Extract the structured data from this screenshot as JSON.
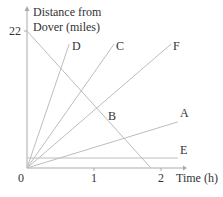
{
  "chart_data": {
    "type": "line",
    "title": "",
    "xlabel": "Time (h)",
    "ylabel": "Distance from Dover (miles)",
    "ylabel_lines": [
      "Distance from",
      "Dover (miles)"
    ],
    "xlim": [
      0,
      2.3
    ],
    "ylim": [
      0,
      24
    ],
    "x_ticks": [
      0,
      1,
      2
    ],
    "x_tick_labels": [
      "0",
      "1",
      "2"
    ],
    "y_ticks": [
      22
    ],
    "y_tick_labels": [
      "22"
    ],
    "grid": false,
    "legend": "inline labels",
    "series": [
      {
        "name": "A",
        "points": [
          [
            0,
            0
          ],
          [
            2.25,
            7.4
          ]
        ]
      },
      {
        "name": "B",
        "points": [
          [
            0,
            22
          ],
          [
            1.85,
            0
          ]
        ]
      },
      {
        "name": "C",
        "points": [
          [
            0,
            0
          ],
          [
            1.3,
            19.9
          ]
        ]
      },
      {
        "name": "D",
        "points": [
          [
            0,
            0
          ],
          [
            0.63,
            19.9
          ]
        ]
      },
      {
        "name": "E",
        "points": [
          [
            0,
            1.6
          ],
          [
            2.25,
            1.6
          ]
        ]
      },
      {
        "name": "F",
        "points": [
          [
            0,
            0
          ],
          [
            2.15,
            19.9
          ]
        ]
      }
    ],
    "colors": {
      "lines": "#bdbdbd",
      "axes": "#aaaaaa",
      "text": "#333333"
    }
  }
}
